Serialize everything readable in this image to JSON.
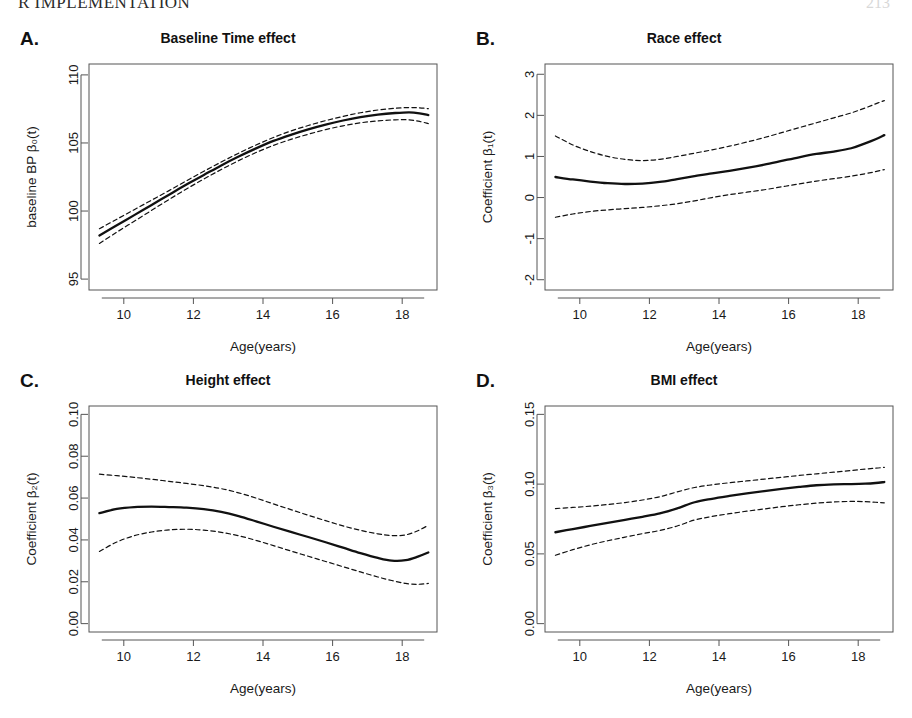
{
  "page": {
    "running_head": "R IMPLEMENTATION",
    "folio": "213"
  },
  "figure": {
    "panels": [
      {
        "letter": "A.",
        "title": "Baseline Time effect"
      },
      {
        "letter": "B.",
        "title": "Race effect"
      },
      {
        "letter": "C.",
        "title": "Height effect"
      },
      {
        "letter": "D.",
        "title": "BMI effect"
      }
    ]
  },
  "chart_data": [
    {
      "id": "panel-A",
      "type": "line",
      "title": "Baseline Time effect",
      "panel_letter": "A.",
      "xlabel": "Age(years)",
      "ylabel": "baseline BP  β₀(t)",
      "xlim": [
        9.0,
        19.0
      ],
      "ylim": [
        94.2,
        110.8
      ],
      "xticks": [
        10,
        12,
        14,
        16,
        18
      ],
      "yticks": [
        95,
        100,
        105,
        110
      ],
      "xticklabels": [
        "10",
        "12",
        "14",
        "16",
        "18"
      ],
      "yticklabels": [
        "95",
        "100",
        "105",
        "110"
      ],
      "grid": false,
      "legend": "none",
      "x": [
        9.3,
        9.8,
        10.3,
        10.8,
        11.3,
        11.8,
        12.3,
        12.8,
        13.3,
        13.8,
        14.3,
        14.8,
        15.3,
        15.8,
        16.3,
        16.8,
        17.3,
        17.8,
        18.2,
        18.5,
        18.75
      ],
      "series": [
        {
          "name": "estimate",
          "style": "solid",
          "values": [
            98.2,
            98.95,
            99.7,
            100.45,
            101.2,
            101.95,
            102.65,
            103.35,
            104.0,
            104.6,
            105.15,
            105.6,
            106.0,
            106.35,
            106.65,
            106.9,
            107.08,
            107.2,
            107.25,
            107.18,
            107.05
          ]
        },
        {
          "name": "upper-95",
          "style": "dashed",
          "values": [
            98.7,
            99.4,
            100.1,
            100.8,
            101.5,
            102.22,
            102.92,
            103.6,
            104.25,
            104.85,
            105.4,
            105.88,
            106.28,
            106.64,
            106.95,
            107.22,
            107.42,
            107.55,
            107.6,
            107.58,
            107.52
          ]
        },
        {
          "name": "lower-95",
          "style": "dashed",
          "values": [
            97.62,
            98.45,
            99.25,
            100.05,
            100.85,
            101.62,
            102.35,
            103.05,
            103.7,
            104.3,
            104.82,
            105.26,
            105.64,
            105.98,
            106.26,
            106.48,
            106.62,
            106.7,
            106.7,
            106.58,
            106.42
          ]
        }
      ]
    },
    {
      "id": "panel-B",
      "type": "line",
      "title": "Race effect",
      "panel_letter": "B.",
      "xlabel": "Age(years)",
      "ylabel": "Coefficient  β₁(t)",
      "xlim": [
        9.0,
        19.0
      ],
      "ylim": [
        -2.25,
        3.25
      ],
      "xticks": [
        10,
        12,
        14,
        16,
        18
      ],
      "yticks": [
        -2,
        -1,
        0,
        1,
        2,
        3
      ],
      "xticklabels": [
        "-2",
        "-1",
        "0",
        "1",
        "2",
        "3"
      ],
      "yticklabels": [
        "-2",
        "-1",
        "0",
        "1",
        "2",
        "3"
      ],
      "grid": false,
      "legend": "none",
      "x": [
        9.3,
        9.8,
        10.3,
        10.8,
        11.3,
        11.8,
        12.3,
        12.8,
        13.3,
        13.8,
        14.3,
        14.8,
        15.3,
        15.8,
        16.3,
        16.8,
        17.3,
        17.8,
        18.2,
        18.5,
        18.75
      ],
      "series": [
        {
          "name": "estimate",
          "style": "solid",
          "values": [
            0.5,
            0.44,
            0.39,
            0.35,
            0.33,
            0.34,
            0.38,
            0.45,
            0.52,
            0.59,
            0.65,
            0.72,
            0.8,
            0.89,
            0.98,
            1.06,
            1.12,
            1.2,
            1.32,
            1.42,
            1.52
          ]
        },
        {
          "name": "upper-95",
          "style": "dashed",
          "values": [
            1.5,
            1.28,
            1.12,
            1.0,
            0.93,
            0.9,
            0.93,
            1.0,
            1.08,
            1.16,
            1.25,
            1.35,
            1.46,
            1.58,
            1.7,
            1.82,
            1.94,
            2.06,
            2.18,
            2.28,
            2.36
          ]
        },
        {
          "name": "lower-95",
          "style": "dashed",
          "values": [
            -0.48,
            -0.4,
            -0.34,
            -0.3,
            -0.27,
            -0.24,
            -0.2,
            -0.15,
            -0.08,
            0.0,
            0.07,
            0.13,
            0.19,
            0.26,
            0.33,
            0.4,
            0.46,
            0.52,
            0.58,
            0.63,
            0.68
          ]
        }
      ]
    },
    {
      "id": "panel-C",
      "type": "line",
      "title": "Height effect",
      "panel_letter": "C.",
      "xlabel": "Age(years)",
      "ylabel": "Coefficient  β₂(t)",
      "xlim": [
        9.0,
        19.0
      ],
      "ylim": [
        -0.004,
        0.104
      ],
      "xticks": [
        10,
        12,
        14,
        16,
        18
      ],
      "yticks": [
        0.0,
        0.02,
        0.04,
        0.06,
        0.08,
        0.1
      ],
      "xticklabels": [
        "10",
        "12",
        "14",
        "16",
        "18"
      ],
      "yticklabels": [
        "0.00",
        "0.02",
        "0.04",
        "0.06",
        "0.08",
        "0.10"
      ],
      "grid": false,
      "legend": "none",
      "x": [
        9.3,
        9.8,
        10.3,
        10.8,
        11.3,
        11.8,
        12.3,
        12.8,
        13.3,
        13.8,
        14.3,
        14.8,
        15.3,
        15.8,
        16.3,
        16.8,
        17.3,
        17.7,
        18.1,
        18.45,
        18.75
      ],
      "series": [
        {
          "name": "estimate",
          "style": "solid",
          "values": [
            0.0528,
            0.0548,
            0.0557,
            0.0559,
            0.0557,
            0.0554,
            0.0547,
            0.0534,
            0.0514,
            0.0489,
            0.0463,
            0.0438,
            0.0414,
            0.0389,
            0.0363,
            0.0337,
            0.0314,
            0.0301,
            0.0303,
            0.032,
            0.034
          ]
        },
        {
          "name": "upper-95",
          "style": "dashed",
          "values": [
            0.0714,
            0.0707,
            0.0699,
            0.069,
            0.068,
            0.067,
            0.0659,
            0.0645,
            0.0625,
            0.06,
            0.0572,
            0.0545,
            0.0518,
            0.0492,
            0.0467,
            0.0446,
            0.0429,
            0.0421,
            0.0424,
            0.0444,
            0.047
          ]
        },
        {
          "name": "lower-95",
          "style": "dashed",
          "values": [
            0.0345,
            0.039,
            0.042,
            0.0438,
            0.0448,
            0.0451,
            0.0447,
            0.0436,
            0.042,
            0.0398,
            0.0373,
            0.0347,
            0.0322,
            0.0297,
            0.0272,
            0.0247,
            0.0223,
            0.0206,
            0.0192,
            0.0188,
            0.0192
          ]
        }
      ]
    },
    {
      "id": "panel-D",
      "type": "line",
      "title": "BMI effect",
      "panel_letter": "D.",
      "xlabel": "Age(years)",
      "ylabel": "Coefficient  β₃(t)",
      "xlim": [
        9.0,
        19.0
      ],
      "ylim": [
        -0.006,
        0.156
      ],
      "xticks": [
        10,
        12,
        14,
        16,
        18
      ],
      "yticks": [
        0.0,
        0.05,
        0.1,
        0.15
      ],
      "xticklabels": [
        "10",
        "12",
        "14",
        "16",
        "18"
      ],
      "yticklabels": [
        "0.00",
        "0.05",
        "0.10",
        "0.15"
      ],
      "grid": false,
      "legend": "none",
      "x": [
        9.3,
        9.8,
        10.3,
        10.8,
        11.3,
        11.8,
        12.3,
        12.8,
        13.3,
        13.8,
        14.3,
        14.8,
        15.3,
        15.8,
        16.3,
        16.8,
        17.3,
        17.8,
        18.2,
        18.5,
        18.75
      ],
      "series": [
        {
          "name": "estimate",
          "style": "solid",
          "values": [
            0.0655,
            0.0678,
            0.07,
            0.0722,
            0.0744,
            0.0766,
            0.079,
            0.0826,
            0.087,
            0.0895,
            0.0915,
            0.0933,
            0.095,
            0.0966,
            0.098,
            0.0992,
            0.0998,
            0.1,
            0.1003,
            0.1008,
            0.1015
          ]
        },
        {
          "name": "upper-95",
          "style": "dashed",
          "values": [
            0.0825,
            0.0833,
            0.0842,
            0.0854,
            0.0868,
            0.0886,
            0.091,
            0.0944,
            0.0976,
            0.0995,
            0.101,
            0.1023,
            0.1036,
            0.1049,
            0.1062,
            0.1074,
            0.1086,
            0.1098,
            0.1108,
            0.1114,
            0.112
          ]
        },
        {
          "name": "lower-95",
          "style": "dashed",
          "values": [
            0.049,
            0.053,
            0.0565,
            0.0594,
            0.062,
            0.0645,
            0.0668,
            0.07,
            0.0743,
            0.0768,
            0.0788,
            0.0806,
            0.0822,
            0.0838,
            0.0852,
            0.0864,
            0.0872,
            0.0876,
            0.0874,
            0.087,
            0.0866
          ]
        }
      ]
    }
  ]
}
